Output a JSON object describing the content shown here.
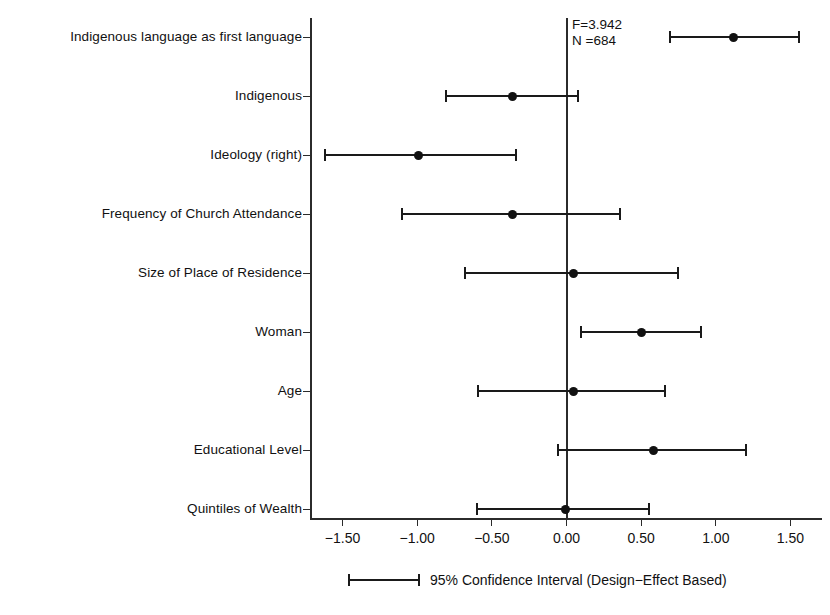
{
  "chart_data": {
    "type": "scatter",
    "title": "",
    "subtitle": "",
    "xlabel": "",
    "ylabel": "",
    "xlim": [
      -1.75,
      1.75
    ],
    "grid": false,
    "legend_position": "bottom",
    "legend_label": "95% Confidence Interval (Design−Effect Based)",
    "annotations": [
      "F=3.942",
      "N =684"
    ],
    "xticks": [
      -1.5,
      -1.0,
      -0.5,
      0.0,
      0.5,
      1.0,
      1.5
    ],
    "xtick_labels": [
      "−1.50",
      "−1.00",
      "−0.50",
      "0.00",
      "0.50",
      "1.00",
      "1.50"
    ],
    "categories": [
      "Indigenous language as first language",
      "Indigenous",
      "Ideology (right)",
      "Frequency of Church Attendance",
      "Size of Place of Residence",
      "Woman",
      "Age",
      "Educational Level",
      "Quintiles of Wealth"
    ],
    "series": [
      {
        "name": "Coefficient with 95% CI",
        "estimates": [
          1.12,
          -0.36,
          -0.99,
          -0.36,
          0.05,
          0.5,
          0.05,
          0.58,
          -0.01
        ],
        "ci_low": [
          0.69,
          -0.81,
          -1.62,
          -1.1,
          -0.68,
          0.1,
          -0.59,
          -0.06,
          -0.6
        ],
        "ci_high": [
          1.56,
          0.08,
          -0.34,
          0.36,
          0.75,
          0.9,
          0.66,
          1.2,
          0.55
        ]
      }
    ],
    "reference_line": 0.0,
    "colors": {
      "marker": "#111111",
      "line": "#1a1a1a",
      "axis": "#2b2b2b",
      "background": "#ffffff"
    }
  }
}
